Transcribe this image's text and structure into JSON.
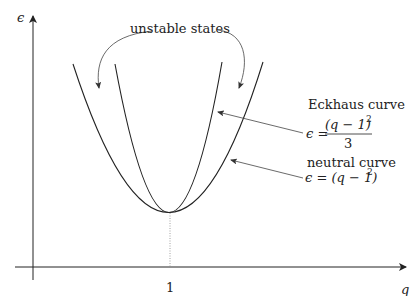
{
  "diagram": {
    "axes": {
      "y_label": "ϵ",
      "x_label": "q",
      "x_tick": "1"
    },
    "annotations": {
      "unstable": "unstable states",
      "eckhaus_title": "Eckhaus curve",
      "eckhaus_lhs": "ϵ =",
      "eckhaus_num": "(q − 1)",
      "eckhaus_exp": "2",
      "eckhaus_den": "3",
      "neutral_title": "neutral curve",
      "neutral_eq": "ϵ = (q − 1)",
      "neutral_exp": "2"
    },
    "curves": [
      {
        "name": "neutral curve",
        "equation": "ϵ = (q − 1)^2"
      },
      {
        "name": "Eckhaus curve",
        "equation": "ϵ = (q − 1)^2 / 3"
      }
    ],
    "colors": {
      "ink": "#222222",
      "dotted": "#888888"
    }
  }
}
